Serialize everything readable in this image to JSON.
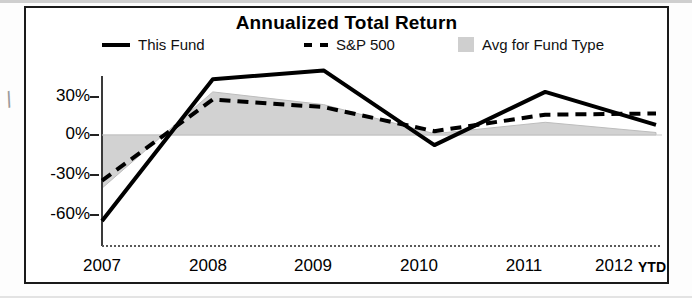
{
  "chart_data": {
    "type": "line",
    "title": "Annualized Total Return",
    "xlabel": "",
    "ylabel": "",
    "categories": [
      "2007",
      "2008",
      "2009",
      "2010",
      "2011",
      "2012 YTD"
    ],
    "x_tick_labels": [
      "2007",
      "2008",
      "2009",
      "2010",
      "2011",
      "2012"
    ],
    "ytd_label": "YTD",
    "y_tick_labels": [
      "30%",
      "0%",
      "-30%",
      "-60%"
    ],
    "y_tick_values": [
      30,
      0,
      -30,
      -60
    ],
    "ylim": [
      -75,
      60
    ],
    "grid": false,
    "legend_position": "top",
    "series": [
      {
        "name": "This Fund",
        "style": "solid",
        "color": "#000000",
        "values": [
          -68,
          44,
          51,
          -8,
          34,
          8
        ]
      },
      {
        "name": "S&P 500",
        "style": "dashed",
        "color": "#000000",
        "values": [
          -36,
          28,
          22,
          3,
          16,
          17
        ]
      },
      {
        "name": "Avg for Fund Type",
        "style": "area",
        "color": "#cfcfcf",
        "values": [
          -42,
          34,
          24,
          1,
          10,
          2
        ]
      }
    ]
  },
  "chart": {
    "title": "Annualized Total Return",
    "legend": [
      {
        "label": "This Fund",
        "swatch": "solid-line-swatch"
      },
      {
        "label": "S&P 500",
        "swatch": "dashed-line-swatch"
      },
      {
        "label": "Avg for Fund Type",
        "swatch": "area-fill-swatch"
      }
    ],
    "y_axis": {
      "ticks": [
        "30%",
        "0%",
        "-30%",
        "-60%"
      ]
    },
    "x_axis": {
      "ticks": [
        "2007",
        "2008",
        "2009",
        "2010",
        "2011",
        "2012"
      ],
      "suffix": "YTD"
    }
  },
  "colors": {
    "line": "#000000",
    "area": "#cfcfcf",
    "frame": "#1a1a1a",
    "background": "#ffffff"
  }
}
